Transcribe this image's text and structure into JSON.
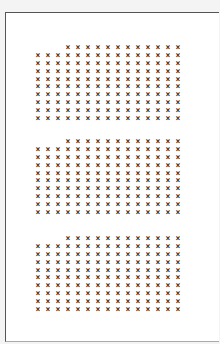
{
  "document": {
    "mark_glyph": "×",
    "columns": 15,
    "blocks": [
      {
        "id": "block-1",
        "top": 31,
        "first_row_start_col": 3,
        "rows": 10
      },
      {
        "id": "block-2",
        "top": 125,
        "first_row_start_col": 3,
        "rows": 10
      },
      {
        "id": "block-3",
        "top": 222,
        "first_row_start_col": 3,
        "rows": 10
      }
    ]
  }
}
